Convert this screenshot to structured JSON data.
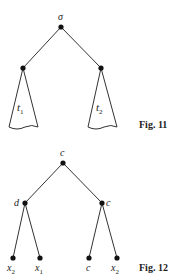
{
  "figures": [
    {
      "caption": "Fig. 11",
      "root_label": "σ",
      "subtree_labels": [
        "t",
        "t"
      ],
      "subtree_subscripts": [
        "1",
        "2"
      ]
    },
    {
      "caption": "Fig. 12",
      "root_label": "c",
      "internal_labels": [
        "d",
        "c"
      ],
      "leaf_labels": [
        "x",
        "x",
        "c",
        "x"
      ],
      "leaf_subscripts": [
        "2",
        "1",
        "",
        "2"
      ]
    }
  ]
}
